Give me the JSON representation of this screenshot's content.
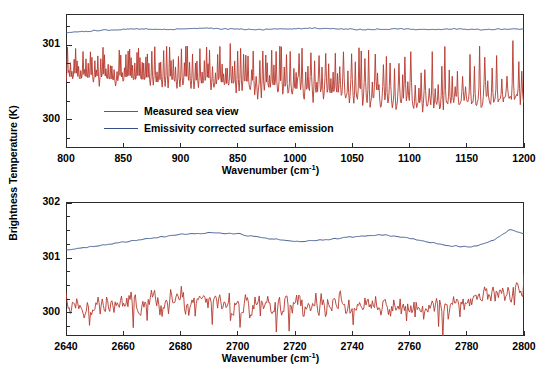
{
  "figure": {
    "y_axis_title": "Brightness Temperature (K)",
    "background_color": "#ffffff",
    "frame_color": "#2b2b2b",
    "series_colors": {
      "measured": "#B5392E",
      "corrected": "#36508A"
    }
  },
  "legend": {
    "position": "inside-top-panel-lower-left",
    "entries": [
      {
        "label": "Measured sea view",
        "color": "#B5392E"
      },
      {
        "label": "Emissivity corrected surface emission",
        "color": "#36508A"
      }
    ]
  },
  "chart_data": [
    {
      "type": "line",
      "panel": "top",
      "title": "",
      "xlabel": "Wavenumber (cm-1)",
      "xlabel_base": "Wavenumber  (cm",
      "xlabel_sup": "-1",
      "xlabel_tail": ")",
      "ylabel": "Brightness Temperature (K)",
      "xlim": [
        800,
        1200
      ],
      "ylim": [
        299.62,
        301.42
      ],
      "xticks": [
        800,
        850,
        900,
        950,
        1000,
        1050,
        1100,
        1150,
        1200
      ],
      "xtick_labels": [
        "800",
        "850",
        "900",
        "850",
        "1000",
        "1050",
        "1100",
        "1150",
        "1200"
      ],
      "yticks": [
        300,
        301
      ],
      "ytick_labels": [
        "300",
        "301"
      ],
      "yminorticks": [
        299.75,
        300.25,
        300.5,
        300.75,
        301.25
      ],
      "grid": false,
      "legend_position": "lower left",
      "series": [
        {
          "name": "Measured sea view",
          "color": "#B5392E",
          "style": "noisy-emission-spikes",
          "baseline_x": [
            800,
            860,
            920,
            980,
            1030,
            1070,
            1110,
            1150,
            1200
          ],
          "baseline_y": [
            300.52,
            300.47,
            300.44,
            300.38,
            300.3,
            300.22,
            300.16,
            300.22,
            300.3
          ],
          "noise_amplitude": 0.085,
          "spike_amplitude_left": 0.42,
          "spike_amplitude_right": 0.78,
          "spike_density_left": 0.4,
          "spike_density_right": 0.17,
          "sample_count": 620,
          "seed": 20873,
          "y_min_observed": 299.95,
          "y_max_observed": 301.12
        },
        {
          "name": "Emissivity corrected surface emission",
          "color": "#36508A",
          "style": "smooth-slightly-wavy",
          "x": [
            800,
            830,
            860,
            890,
            915,
            940,
            965,
            990,
            1015,
            1040,
            1065,
            1090,
            1115,
            1140,
            1165,
            1200
          ],
          "y": [
            301.17,
            301.2,
            301.22,
            301.21,
            301.23,
            301.22,
            301.21,
            301.22,
            301.23,
            301.22,
            301.21,
            301.22,
            301.21,
            301.22,
            301.21,
            301.22
          ],
          "noise_amplitude": 0.012,
          "sample_count": 620,
          "seed": 5512
        }
      ]
    },
    {
      "type": "line",
      "panel": "bottom",
      "title": "",
      "xlabel": "Wavenumber (cm-1)",
      "xlabel_base": "Wavenumber  (cm",
      "xlabel_sup": "-1",
      "xlabel_tail": ")",
      "ylabel": "Brightness Temperature (K)",
      "xlim": [
        2640,
        2800
      ],
      "ylim": [
        299.58,
        302.02
      ],
      "xticks": [
        2640,
        2660,
        2680,
        2700,
        2720,
        2740,
        2760,
        2780,
        2800
      ],
      "xtick_labels": [
        "2640",
        "2660",
        "2680",
        "2700",
        "2720",
        "2740",
        "2760",
        "2780",
        "2800"
      ],
      "yticks": [
        300,
        301,
        302
      ],
      "ytick_labels": [
        "300",
        "301",
        "302"
      ],
      "yminorticks": [
        299.75,
        300.25,
        300.5,
        300.75,
        301.25,
        301.5,
        301.75
      ],
      "grid": false,
      "legend_position": "none",
      "series": [
        {
          "name": "Measured sea view",
          "color": "#B5392E",
          "style": "noisy-oscillating",
          "baseline_x": [
            2640,
            2665,
            2690,
            2710,
            2730,
            2750,
            2770,
            2785,
            2800
          ],
          "baseline_y": [
            300.1,
            300.18,
            300.2,
            300.1,
            300.14,
            300.16,
            300.12,
            300.28,
            300.48
          ],
          "noise_amplitude": 0.22,
          "spike_amplitude_down": 0.34,
          "sample_count": 430,
          "seed": 31177,
          "y_min_observed": 299.62,
          "y_max_observed": 300.72
        },
        {
          "name": "Emissivity corrected surface emission",
          "color": "#36508A",
          "style": "smooth-broad-hump",
          "x": [
            2640,
            2650,
            2660,
            2670,
            2680,
            2690,
            2700,
            2710,
            2720,
            2730,
            2740,
            2750,
            2758,
            2766,
            2774,
            2782,
            2790,
            2795,
            2800
          ],
          "y": [
            301.15,
            301.21,
            301.29,
            301.36,
            301.43,
            301.46,
            301.44,
            301.36,
            301.3,
            301.33,
            301.38,
            301.42,
            301.38,
            301.3,
            301.22,
            301.2,
            301.34,
            301.52,
            301.44
          ],
          "noise_amplitude": 0.018,
          "sample_count": 430,
          "seed": 9043
        }
      ]
    }
  ]
}
